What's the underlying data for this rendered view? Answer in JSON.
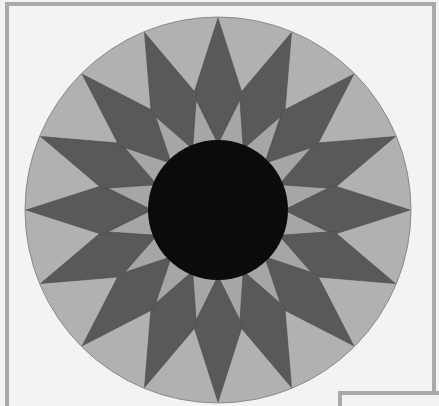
{
  "quilt_block": {
    "pattern": "16-point sunburst star",
    "center": [
      218,
      210
    ],
    "outer_radius": 193,
    "inner_circle_radius": 70,
    "point_count": 16,
    "point_wide_radius": 118,
    "point_half_angle_deg": 12,
    "point_inner_radius": 66,
    "rotation_deg": -90,
    "colors": {
      "background": "#f3f3f3",
      "frame": "#a9a9a9",
      "outer_ring": "#b1b1b1",
      "outer_ring_edge": "#8a8a8a",
      "light_wedge": "#a6a6a6",
      "dark_point": "#595959",
      "point_edge": "#4a4a4a",
      "center_circle": "#0b0b0b"
    }
  }
}
